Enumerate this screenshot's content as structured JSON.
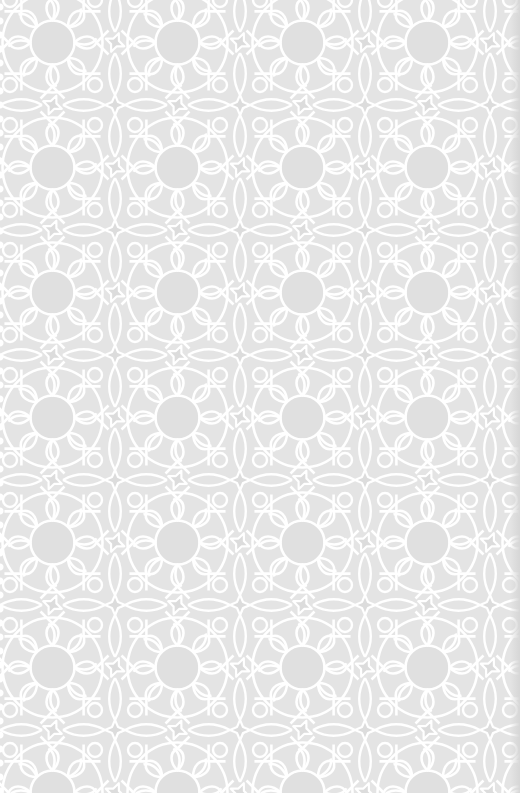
{
  "image": {
    "description": "White geometric lace pattern (interlaced rosettes and eight-point stars) on light gray fabric",
    "pattern": {
      "motif": "rosette-and-star lattice",
      "tile_size_px": 125,
      "background_color": "#e4e4e4",
      "line_color": "#ffffff",
      "shade_color": "#dcdcdc"
    }
  }
}
